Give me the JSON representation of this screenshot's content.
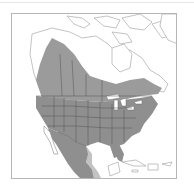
{
  "map": {
    "subject": "North America range map",
    "colors": {
      "range_fill": "#8f8f8f",
      "range_light": "#b9b9b9",
      "land_fill": "#ffffff",
      "border_line": "#555555",
      "coast_line": "#9a9a9a",
      "frame": "#b5b5b5"
    },
    "regions": [
      {
        "name": "Canada",
        "shaded": "partial"
      },
      {
        "name": "United States",
        "shaded": true
      },
      {
        "name": "Mexico",
        "shaded": true
      },
      {
        "name": "Caribbean",
        "shaded": false
      },
      {
        "name": "Greenland",
        "shaded": false
      }
    ]
  }
}
